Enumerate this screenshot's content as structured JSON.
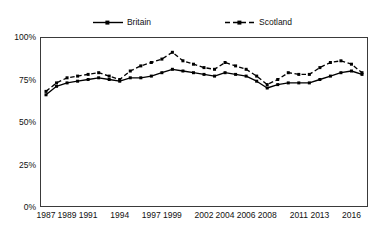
{
  "chart_data": {
    "type": "line",
    "title": "",
    "subtitle": "",
    "xlabel": "",
    "ylabel": "",
    "ylim": [
      0,
      100
    ],
    "y_ticks": [
      "0%",
      "25%",
      "50%",
      "75%",
      "100%"
    ],
    "y_tick_values": [
      0,
      25,
      50,
      75,
      100
    ],
    "grid": false,
    "legend_position": "top-center",
    "x": [
      1987,
      1988,
      1989,
      1990,
      1991,
      1992,
      1993,
      1994,
      1995,
      1996,
      1997,
      1998,
      1999,
      2000,
      2001,
      2002,
      2003,
      2004,
      2005,
      2006,
      2007,
      2008,
      2009,
      2010,
      2011,
      2012,
      2013,
      2014,
      2015,
      2016,
      2017
    ],
    "x_tick_labels": [
      "1987",
      "1989",
      "1991",
      "1994",
      "1997",
      "1999",
      "2002",
      "2004",
      "2006",
      "2008",
      "2011",
      "2013",
      "2016"
    ],
    "x_tick_values": [
      1987,
      1989,
      1991,
      1994,
      1997,
      1999,
      2002,
      2004,
      2006,
      2008,
      2011,
      2013,
      2016
    ],
    "series": [
      {
        "name": "Britain",
        "style": "solid",
        "color": "#000000",
        "marker": "square",
        "values": [
          66,
          71,
          73,
          74,
          75,
          76,
          75,
          74,
          76,
          76,
          77,
          79,
          81,
          80,
          79,
          78,
          77,
          79,
          78,
          77,
          74,
          70,
          72,
          73,
          73,
          73,
          75,
          77,
          79,
          80,
          78
        ]
      },
      {
        "name": "Scotland",
        "style": "dashed",
        "color": "#000000",
        "marker": "square",
        "values": [
          68,
          73,
          76,
          77,
          78,
          79,
          77,
          75,
          80,
          83,
          85,
          87,
          91,
          86,
          84,
          82,
          81,
          85,
          83,
          81,
          77,
          72,
          75,
          79,
          78,
          78,
          82,
          85,
          86,
          84,
          79
        ]
      }
    ]
  },
  "legend": {
    "entries": [
      {
        "label": "Britain",
        "icon": "solid-line-marker-icon"
      },
      {
        "label": "Scotland",
        "icon": "dashed-line-marker-icon"
      }
    ]
  }
}
